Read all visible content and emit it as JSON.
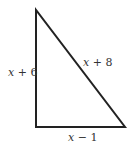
{
  "diagram": {
    "type": "right-triangle",
    "vertices": {
      "top": [
        36,
        10
      ],
      "bottom_left": [
        36,
        127
      ],
      "bottom_right": [
        125,
        127
      ]
    },
    "stroke_color": "#222222",
    "sides": {
      "left": {
        "var": "x",
        "rest": " + 6",
        "label": "x + 6"
      },
      "hypotenuse": {
        "var": "x",
        "rest": " + 8",
        "label": "x + 8"
      },
      "bottom": {
        "var": "x",
        "rest": " − 1",
        "label": "x − 1"
      }
    }
  }
}
